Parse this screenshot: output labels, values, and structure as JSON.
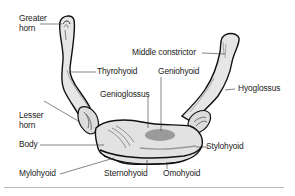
{
  "figure": {
    "colors": {
      "bone_fill": "#e4e4e4",
      "bone_outline": "#111111",
      "highlight_fill": "#9a9a9a",
      "leader_line": "#333333",
      "label_text": "#222222",
      "rule": "#b8b8b8"
    },
    "labels": {
      "greater_horn_line1": "Greater",
      "greater_horn_line2": "horn",
      "middle_constrictor": "Middle constrictor",
      "thyrohyoid": "Thyrohyoid",
      "geniohyoid": "Geniohyoid",
      "genioglossus": "Genioglossus",
      "hyoglossus": "Hyoglossus",
      "lesser_horn_line1": "Lesser",
      "lesser_horn_line2": "horn",
      "body": "Body",
      "stylohyoid": "Stylohyoid",
      "mylohyoid": "Mylohyoid",
      "sternohyoid": "Sternohyoid",
      "omohyoid": "Omohyoid"
    }
  }
}
